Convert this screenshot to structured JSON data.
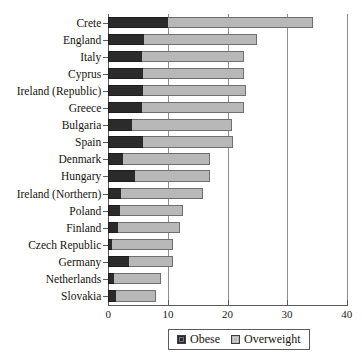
{
  "chart_data": {
    "type": "bar",
    "orientation": "horizontal",
    "stacked": true,
    "title": "",
    "subtitle": "",
    "xlabel": "",
    "ylabel": "",
    "xlim": [
      0,
      40
    ],
    "xticks": [
      0,
      10,
      20,
      30,
      40
    ],
    "xtick_labels": [
      "0",
      "10",
      "20",
      "30",
      "40"
    ],
    "grid": true,
    "grid_axis": "x",
    "legend": {
      "position": "bottom",
      "entries": [
        {
          "name": "Obese",
          "color": "#2b2b2b"
        },
        {
          "name": "Overweight",
          "color": "#b8b8b8"
        }
      ]
    },
    "categories": [
      "Crete",
      "England",
      "Italy",
      "Cyprus",
      "Ireland (Republic)",
      "Greece",
      "Bulgaria",
      "Spain",
      "Denmark",
      "Hungary",
      "Ireland (Northern)",
      "Poland",
      "Finland",
      "Czech Republic",
      "Germany",
      "Netherlands",
      "Slovakia"
    ],
    "series": [
      {
        "name": "Obese",
        "color": "#2b2b2b",
        "values": [
          10.0,
          6.0,
          5.6,
          5.8,
          5.8,
          5.6,
          4.0,
          5.8,
          2.5,
          4.5,
          2.2,
          1.9,
          1.6,
          0.7,
          3.4,
          0.9,
          1.3
        ]
      },
      {
        "name": "Overweight",
        "color": "#b8b8b8",
        "values": [
          24.4,
          19.0,
          17.2,
          17.0,
          17.3,
          17.2,
          16.8,
          15.2,
          14.6,
          12.5,
          13.7,
          10.7,
          10.5,
          10.2,
          7.5,
          8.0,
          6.7
        ]
      }
    ],
    "totals": [
      34.4,
      25.0,
      22.8,
      22.8,
      23.1,
      22.8,
      20.8,
      21.0,
      17.1,
      17.0,
      15.9,
      12.6,
      12.1,
      10.9,
      10.9,
      8.9,
      8.0
    ]
  }
}
